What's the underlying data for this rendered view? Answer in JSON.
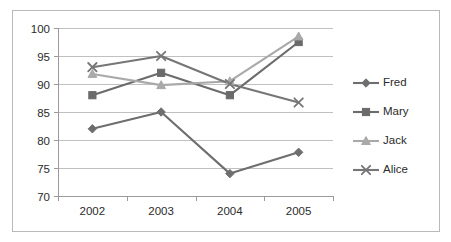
{
  "chart_data": {
    "type": "line",
    "title": "",
    "subtitle": "",
    "xlabel": "",
    "ylabel": "",
    "categories": [
      "2002",
      "2003",
      "2004",
      "2005"
    ],
    "x": [
      2002,
      2003,
      2004,
      2005
    ],
    "ylim": [
      70,
      100
    ],
    "yticks": [
      70,
      75,
      80,
      85,
      90,
      95,
      100
    ],
    "ytick_labels": [
      "70",
      "75",
      "80",
      "85",
      "90",
      "95",
      "100"
    ],
    "grid": "horizontal",
    "legend_position": "right",
    "series": [
      {
        "name": "Fred",
        "marker": "diamond",
        "color": "#6e6e6e",
        "values": [
          82,
          85,
          74,
          77.8
        ]
      },
      {
        "name": "Mary",
        "marker": "square",
        "color": "#6b6b6b",
        "values": [
          88,
          92,
          88,
          97.5
        ]
      },
      {
        "name": "Jack",
        "marker": "triangle",
        "color": "#a9a9a9",
        "values": [
          91.8,
          89.8,
          90.5,
          98.5
        ]
      },
      {
        "name": "Alice",
        "marker": "x",
        "color": "#767676",
        "values": [
          93,
          95,
          90,
          86.7
        ]
      }
    ]
  },
  "legend": {
    "entries": [
      {
        "label": "Fred"
      },
      {
        "label": "Mary"
      },
      {
        "label": "Jack"
      },
      {
        "label": "Alice"
      }
    ]
  },
  "colors": {
    "frame_border": "#b9b9b9",
    "gridline": "#c0c0c0",
    "axis": "#9a9a9a",
    "text": "#2b2b2b",
    "background": "#ffffff"
  }
}
